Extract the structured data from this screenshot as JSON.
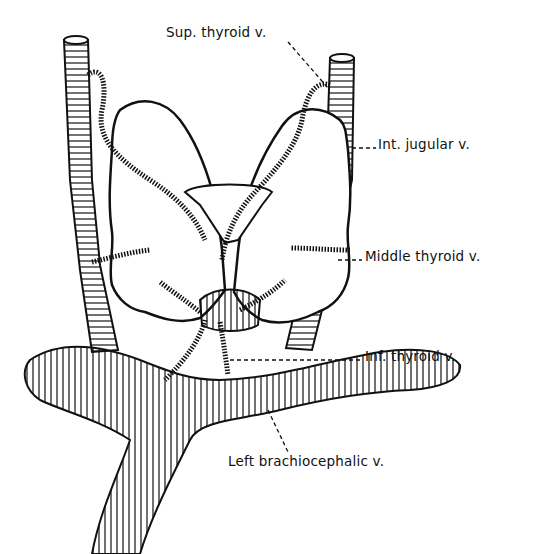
{
  "diagram": {
    "colors": {
      "ink": "#111111",
      "background": "#ffffff"
    },
    "labels": {
      "sup_thyroid": "Sup. thyroid v.",
      "int_jugular": "Int. jugular v.",
      "middle_thyroid": "Middle thyroid v.",
      "inf_thyroid": "Inf. thyroid v.",
      "left_brachiocephalic": "Left brachiocephalic v."
    },
    "structures": [
      "right-internal-jugular-vein",
      "left-internal-jugular-vein",
      "thyroid-gland-right-lobe",
      "thyroid-gland-left-lobe",
      "thyroid-isthmus",
      "thyroid-cartilage",
      "superior-thyroid-veins",
      "middle-thyroid-veins",
      "inferior-thyroid-veins",
      "left-brachiocephalic-vein",
      "right-brachiocephalic-vein"
    ]
  }
}
